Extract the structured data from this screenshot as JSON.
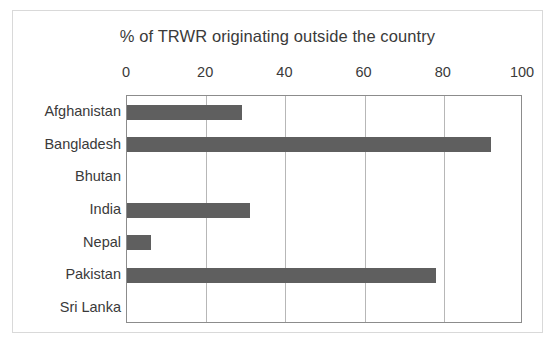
{
  "chart_data": {
    "type": "bar",
    "orientation": "horizontal",
    "title": "% of TRWR originating outside the country",
    "xlabel": "",
    "ylabel": "",
    "categories": [
      "Afghanistan",
      "Bangladesh",
      "Bhutan",
      "India",
      "Nepal",
      "Pakistan",
      "Sri Lanka"
    ],
    "values": [
      29,
      92,
      0,
      31,
      6,
      78,
      0
    ],
    "xlim": [
      0,
      100
    ],
    "xticks": [
      0,
      20,
      40,
      60,
      80,
      100
    ],
    "xtick_labels": [
      "0",
      "20",
      "40",
      "60",
      "80",
      "100"
    ],
    "grid": "vertical",
    "legend": "none",
    "series": [
      {
        "name": "% of TRWR originating outside the country",
        "color": "#5f5f5f",
        "values": [
          29,
          92,
          0,
          31,
          6,
          78,
          0
        ]
      }
    ]
  },
  "colors": {
    "bar": "#5f5f5f",
    "plot_border": "#8c8c8c",
    "gridline": "#b7b7b7",
    "card_border": "#d9d9d9",
    "text": "#3a3a3a",
    "background": "#ffffff"
  }
}
